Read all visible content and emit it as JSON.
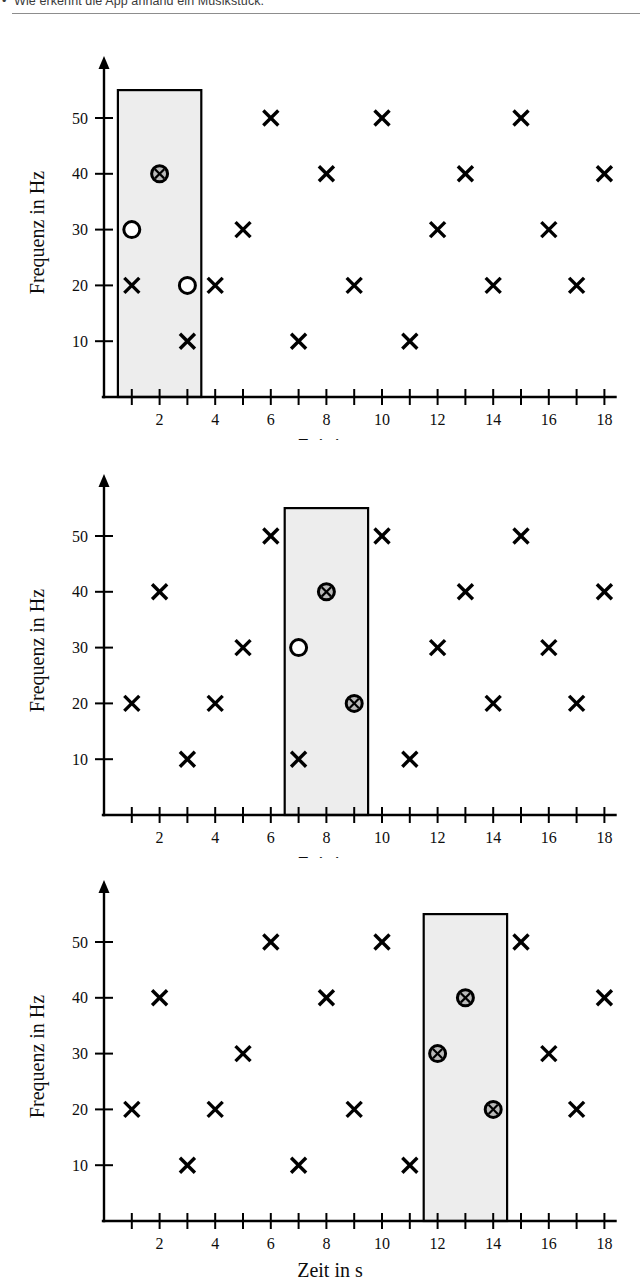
{
  "header": {
    "bullet": "•",
    "text": "Wie erkennt die App anhand ein Musikstück."
  },
  "axis_labels": {
    "y": "Frequenz in Hz",
    "x": "Zeit in s"
  },
  "colors": {
    "ink": "#000000",
    "band_fill": "#ededed",
    "band_stroke": "#000000",
    "marker_fill": "#b9b9b9",
    "rule": "#8d8d8d",
    "page": "#ffffff"
  },
  "markers": {
    "cross": "x-marker",
    "circle": "circle-marker",
    "circle_cross": "circle-cross-marker"
  },
  "chart_data": [
    {
      "type": "scatter",
      "title": "",
      "xlabel": "Zeit in s",
      "ylabel": "Frequenz in Hz",
      "xlim": [
        0,
        18.9
      ],
      "ylim": [
        0,
        57
      ],
      "xticks": [
        1,
        2,
        3,
        4,
        5,
        6,
        7,
        8,
        9,
        10,
        11,
        12,
        13,
        14,
        15,
        16,
        17,
        18
      ],
      "xticklabels": [
        "",
        "2",
        "",
        "4",
        "",
        "6",
        "",
        "8",
        "",
        "10",
        "",
        "12",
        "",
        "14",
        "",
        "16",
        "",
        "18"
      ],
      "yticks": [
        10,
        20,
        30,
        40,
        50
      ],
      "yticklabels": [
        "10",
        "20",
        "30",
        "40",
        "50"
      ],
      "grid": false,
      "legend": "none",
      "highlight_band": {
        "x_start": 0.5,
        "x_end": 3.5,
        "y_top": 55
      },
      "points": [
        {
          "x": 1,
          "y": 20,
          "marker": "cross"
        },
        {
          "x": 1,
          "y": 30,
          "marker": "circle"
        },
        {
          "x": 2,
          "y": 40,
          "marker": "circle_cross"
        },
        {
          "x": 3,
          "y": 20,
          "marker": "circle"
        },
        {
          "x": 3,
          "y": 10,
          "marker": "cross"
        },
        {
          "x": 4,
          "y": 20,
          "marker": "cross"
        },
        {
          "x": 5,
          "y": 30,
          "marker": "cross"
        },
        {
          "x": 6,
          "y": 50,
          "marker": "cross"
        },
        {
          "x": 7,
          "y": 10,
          "marker": "cross"
        },
        {
          "x": 8,
          "y": 40,
          "marker": "cross"
        },
        {
          "x": 9,
          "y": 20,
          "marker": "cross"
        },
        {
          "x": 10,
          "y": 50,
          "marker": "cross"
        },
        {
          "x": 11,
          "y": 10,
          "marker": "cross"
        },
        {
          "x": 12,
          "y": 30,
          "marker": "cross"
        },
        {
          "x": 13,
          "y": 40,
          "marker": "cross"
        },
        {
          "x": 14,
          "y": 20,
          "marker": "cross"
        },
        {
          "x": 15,
          "y": 50,
          "marker": "cross"
        },
        {
          "x": 16,
          "y": 30,
          "marker": "cross"
        },
        {
          "x": 17,
          "y": 20,
          "marker": "cross"
        },
        {
          "x": 18,
          "y": 40,
          "marker": "cross"
        }
      ]
    },
    {
      "type": "scatter",
      "title": "",
      "xlabel": "Zeit in s",
      "ylabel": "Frequenz in Hz",
      "xlim": [
        0,
        18.9
      ],
      "ylim": [
        0,
        57
      ],
      "xticks": [
        1,
        2,
        3,
        4,
        5,
        6,
        7,
        8,
        9,
        10,
        11,
        12,
        13,
        14,
        15,
        16,
        17,
        18
      ],
      "xticklabels": [
        "",
        "2",
        "",
        "4",
        "",
        "6",
        "",
        "8",
        "",
        "10",
        "",
        "12",
        "",
        "14",
        "",
        "16",
        "",
        "18"
      ],
      "yticks": [
        10,
        20,
        30,
        40,
        50
      ],
      "yticklabels": [
        "10",
        "20",
        "30",
        "40",
        "50"
      ],
      "grid": false,
      "legend": "none",
      "highlight_band": {
        "x_start": 6.5,
        "x_end": 9.5,
        "y_top": 55
      },
      "points": [
        {
          "x": 1,
          "y": 20,
          "marker": "cross"
        },
        {
          "x": 2,
          "y": 40,
          "marker": "cross"
        },
        {
          "x": 3,
          "y": 10,
          "marker": "cross"
        },
        {
          "x": 4,
          "y": 20,
          "marker": "cross"
        },
        {
          "x": 5,
          "y": 30,
          "marker": "cross"
        },
        {
          "x": 6,
          "y": 50,
          "marker": "cross"
        },
        {
          "x": 7,
          "y": 10,
          "marker": "cross"
        },
        {
          "x": 7,
          "y": 30,
          "marker": "circle"
        },
        {
          "x": 8,
          "y": 40,
          "marker": "circle_cross"
        },
        {
          "x": 9,
          "y": 20,
          "marker": "circle_cross"
        },
        {
          "x": 10,
          "y": 50,
          "marker": "cross"
        },
        {
          "x": 11,
          "y": 10,
          "marker": "cross"
        },
        {
          "x": 12,
          "y": 30,
          "marker": "cross"
        },
        {
          "x": 13,
          "y": 40,
          "marker": "cross"
        },
        {
          "x": 14,
          "y": 20,
          "marker": "cross"
        },
        {
          "x": 15,
          "y": 50,
          "marker": "cross"
        },
        {
          "x": 16,
          "y": 30,
          "marker": "cross"
        },
        {
          "x": 17,
          "y": 20,
          "marker": "cross"
        },
        {
          "x": 18,
          "y": 40,
          "marker": "cross"
        }
      ]
    },
    {
      "type": "scatter",
      "title": "",
      "xlabel": "Zeit in s",
      "ylabel": "Frequenz in Hz",
      "xlim": [
        0,
        18.9
      ],
      "ylim": [
        0,
        57
      ],
      "xticks": [
        1,
        2,
        3,
        4,
        5,
        6,
        7,
        8,
        9,
        10,
        11,
        12,
        13,
        14,
        15,
        16,
        17,
        18
      ],
      "xticklabels": [
        "",
        "2",
        "",
        "4",
        "",
        "6",
        "",
        "8",
        "",
        "10",
        "",
        "12",
        "",
        "14",
        "",
        "16",
        "",
        "18"
      ],
      "yticks": [
        10,
        20,
        30,
        40,
        50
      ],
      "yticklabels": [
        "10",
        "20",
        "30",
        "40",
        "50"
      ],
      "grid": false,
      "legend": "none",
      "highlight_band": {
        "x_start": 11.5,
        "x_end": 14.5,
        "y_top": 55
      },
      "points": [
        {
          "x": 1,
          "y": 20,
          "marker": "cross"
        },
        {
          "x": 2,
          "y": 40,
          "marker": "cross"
        },
        {
          "x": 3,
          "y": 10,
          "marker": "cross"
        },
        {
          "x": 4,
          "y": 20,
          "marker": "cross"
        },
        {
          "x": 5,
          "y": 30,
          "marker": "cross"
        },
        {
          "x": 6,
          "y": 50,
          "marker": "cross"
        },
        {
          "x": 7,
          "y": 10,
          "marker": "cross"
        },
        {
          "x": 8,
          "y": 40,
          "marker": "cross"
        },
        {
          "x": 9,
          "y": 20,
          "marker": "cross"
        },
        {
          "x": 10,
          "y": 50,
          "marker": "cross"
        },
        {
          "x": 11,
          "y": 10,
          "marker": "cross"
        },
        {
          "x": 12,
          "y": 30,
          "marker": "circle_cross"
        },
        {
          "x": 13,
          "y": 40,
          "marker": "circle_cross"
        },
        {
          "x": 14,
          "y": 20,
          "marker": "circle_cross"
        },
        {
          "x": 15,
          "y": 50,
          "marker": "cross"
        },
        {
          "x": 16,
          "y": 30,
          "marker": "cross"
        },
        {
          "x": 17,
          "y": 20,
          "marker": "cross"
        },
        {
          "x": 18,
          "y": 40,
          "marker": "cross"
        }
      ]
    }
  ]
}
